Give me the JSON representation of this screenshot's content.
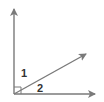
{
  "diagram": {
    "type": "geometry-angles",
    "line_color": "#7a7a7a",
    "label_color": "#333333",
    "vertex": {
      "x": 14,
      "y": 94
    },
    "rays": [
      {
        "name": "vertical-ray",
        "tip": {
          "x": 14,
          "y": 9
        }
      },
      {
        "name": "diagonal-ray",
        "tip": {
          "x": 86,
          "y": 54
        }
      },
      {
        "name": "horizontal-ray",
        "tip": {
          "x": 95,
          "y": 94
        }
      }
    ],
    "right_angle_marker": true,
    "labels": [
      {
        "text": "1",
        "x": 21,
        "y": 77
      },
      {
        "text": "2",
        "x": 37,
        "y": 92
      }
    ]
  }
}
